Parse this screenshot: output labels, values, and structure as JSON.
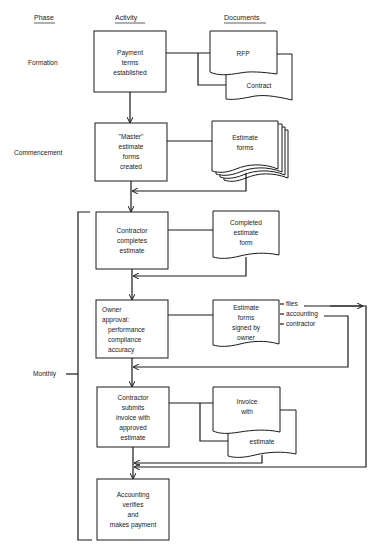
{
  "headers": {
    "phase": "Phase",
    "activity": "Activity",
    "documents": "Documents"
  },
  "phases": {
    "formation": "Formation",
    "commencement": "Commencement",
    "monthly": "Monthly"
  },
  "activities": [
    {
      "lines": [
        "Payment",
        "terms",
        "established"
      ]
    },
    {
      "lines": [
        "\"Master\"",
        "estimate",
        "forms",
        "created"
      ]
    },
    {
      "lines": [
        "Contractor",
        "completes",
        "estimate"
      ]
    },
    {
      "lines": [
        "Owner",
        "approval:",
        "performance",
        "compliance",
        "accuracy"
      ]
    },
    {
      "lines": [
        "Contractor",
        "submits",
        "invoice with",
        "approved",
        "estimate"
      ]
    },
    {
      "lines": [
        "Accounting",
        "verifies",
        "and",
        "makes payment"
      ]
    }
  ],
  "documents": {
    "rfp": "RFP",
    "contract": "Contract",
    "estimate_forms": [
      "Estimate",
      "forms"
    ],
    "completed_estimate": [
      "Completed",
      "estimate",
      "form"
    ],
    "signed_forms": [
      "Estimate",
      "forms",
      "signed by",
      "owner"
    ],
    "invoice": [
      "Invoice",
      "with"
    ],
    "invoice_estimate": "estimate"
  },
  "distribution": {
    "files": "files",
    "accounting": "accounting",
    "contractor": "contractor"
  }
}
